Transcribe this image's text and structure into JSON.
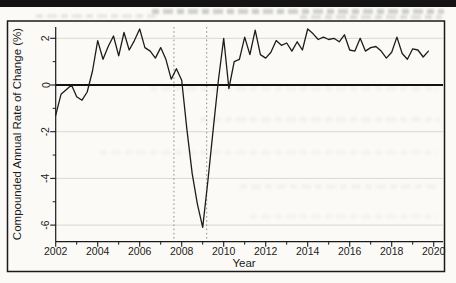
{
  "chart_data": {
    "type": "line",
    "title": "",
    "xlabel": "Year",
    "ylabel": "Compounded Annual Rate of Change (%)",
    "x_start": 2002.0,
    "x_step": 0.25,
    "values": [
      -1.3,
      -0.4,
      -0.2,
      0.0,
      -0.5,
      -0.65,
      -0.3,
      0.6,
      1.9,
      1.1,
      1.65,
      2.1,
      1.25,
      2.25,
      1.5,
      1.9,
      2.4,
      1.6,
      1.45,
      1.15,
      1.6,
      1.1,
      0.25,
      0.7,
      0.2,
      -1.9,
      -3.8,
      -5.1,
      -6.1,
      -4.1,
      -1.9,
      0.2,
      2.0,
      -0.15,
      1.0,
      1.1,
      2.05,
      1.3,
      2.35,
      1.3,
      1.15,
      1.4,
      1.9,
      1.7,
      1.8,
      1.45,
      1.85,
      1.5,
      2.4,
      2.2,
      1.95,
      2.05,
      1.95,
      2.0,
      1.85,
      2.15,
      1.5,
      1.45,
      2.0,
      1.45,
      1.6,
      1.65,
      1.45,
      1.15,
      1.4,
      2.05,
      1.35,
      1.1,
      1.55,
      1.5,
      1.2,
      1.45
    ],
    "xlim": [
      2001.97,
      2020.45
    ],
    "ylim": [
      -6.72,
      2.49
    ],
    "x_major_ticks": [
      2002,
      2004,
      2006,
      2008,
      2010,
      2012,
      2014,
      2016,
      2018,
      2020
    ],
    "x_major_tick_labels": [
      "2002",
      "2004",
      "2006",
      "2008",
      "2010",
      "2012",
      "2014",
      "2016",
      "2018",
      "2020"
    ],
    "x_minor_ticks": [
      2003,
      2005,
      2007,
      2009,
      2011,
      2013,
      2015,
      2017,
      2019
    ],
    "y_major_ticks": [
      2,
      0,
      -2,
      -4,
      -6
    ],
    "y_major_tick_labels": [
      "2",
      "0",
      "-2",
      "-4",
      "-6"
    ],
    "y_minor_ticks": [
      1,
      -1,
      -3,
      -5
    ],
    "gridline_values": [
      2,
      -2,
      -4,
      -6
    ],
    "zero_line_value": 0,
    "vline_positions": [
      2007.63,
      2009.19
    ],
    "legend": "none",
    "grid_on": true,
    "line_color": "#1c1c1c",
    "axis_color": "#1a1a1a",
    "grid_color": "#d9d8d0",
    "vline_color": "#8f8f8f"
  }
}
